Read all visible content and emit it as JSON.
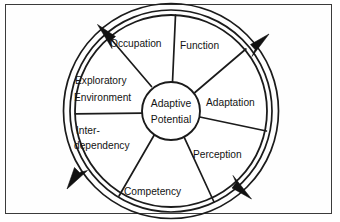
{
  "figure": {
    "border_color": "#3b3b3b",
    "line_color": "#1b1b1b",
    "background_color": "#ffffff"
  },
  "hub": {
    "line1": "Adaptive",
    "line2": "Potential"
  },
  "sectors": [
    {
      "id": "function",
      "label": "Function",
      "line1": "Function",
      "line2": ""
    },
    {
      "id": "adaptation",
      "label": "Adaptation",
      "line1": "Adaptation",
      "line2": ""
    },
    {
      "id": "perception",
      "label": "Perception",
      "line1": "Perception",
      "line2": ""
    },
    {
      "id": "competency",
      "label": "Competency",
      "line1": "Competency",
      "line2": ""
    },
    {
      "id": "interdependency",
      "label": "Inter-dependency",
      "line1": "Inter-",
      "line2": "dependency"
    },
    {
      "id": "exploratory-environment",
      "label": "Exploratory Environment",
      "line1": "Exploratory",
      "line2": "Environment"
    },
    {
      "id": "occupation",
      "label": "Occupation",
      "line1": "Occupation",
      "line2": ""
    }
  ],
  "ring": {
    "style": "double-line circle with four arrowheads",
    "arrow_count": 4,
    "direction": "counterclockwise"
  }
}
